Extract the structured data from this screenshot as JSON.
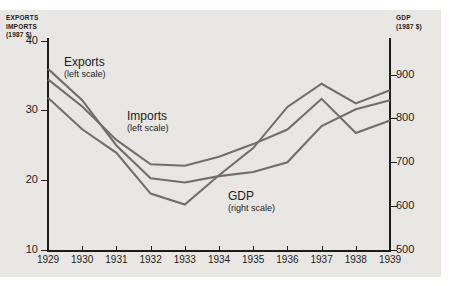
{
  "chart_data": {
    "type": "line",
    "title": "",
    "xlabel": "",
    "x": [
      1929,
      1930,
      1931,
      1932,
      1933,
      1934,
      1935,
      1936,
      1937,
      1938,
      1939
    ],
    "xticklabels": [
      "1929",
      "1930",
      "1931",
      "1932",
      "1933",
      "1934",
      "1935",
      "1936",
      "1937",
      "1938",
      "1939"
    ],
    "grid": false,
    "legend": "inline-annotations",
    "axes": [
      {
        "id": "left",
        "label": "EXPORTS\nIMPORTS\n(1987 $)",
        "label_lines": [
          "EXPORTS",
          "IMPORTS",
          "(1987 $)"
        ],
        "ylim": [
          10,
          40
        ],
        "yticks": [
          10,
          20,
          30,
          40
        ],
        "yticklabels": [
          "10",
          "20",
          "30",
          "40"
        ]
      },
      {
        "id": "right",
        "label": "GDP\n(1987 $)",
        "label_lines": [
          "GDP",
          "(1987 $)"
        ],
        "ylim": [
          500,
          900
        ],
        "yticks": [
          500,
          600,
          700,
          800,
          900
        ],
        "yticklabels": [
          "500",
          "600",
          "700",
          "800",
          "900"
        ]
      }
    ],
    "series": [
      {
        "name": "Exports",
        "scale_note": "(left scale)",
        "axis": "left",
        "color": "#6f6f6f",
        "values": [
          36.0,
          31.5,
          25.0,
          20.3,
          19.7,
          20.6,
          21.2,
          22.6,
          27.8,
          30.2,
          31.5
        ]
      },
      {
        "name": "Imports",
        "scale_note": "(left scale)",
        "axis": "left",
        "color": "#6f6f6f",
        "values": [
          34.5,
          30.6,
          25.8,
          22.3,
          22.1,
          23.4,
          25.2,
          27.3,
          31.7,
          26.8,
          28.6
        ]
      },
      {
        "name": "GDP",
        "scale_note": "(right scale)",
        "axis": "right",
        "color": "#6f6f6f",
        "values": [
          848,
          776,
          722,
          629,
          604,
          671,
          733,
          827,
          880,
          835,
          865
        ]
      }
    ]
  },
  "annotations": [
    {
      "name": "Exports",
      "scale_note": "(left scale)"
    },
    {
      "name": "Imports",
      "scale_note": "(left scale)"
    },
    {
      "name": "GDP",
      "scale_note": "(right scale)"
    }
  ],
  "style": {
    "panel_background": "#e9e7e3",
    "line_color": "#6f6f6f",
    "axis_color": "#1c1c1c",
    "page_background": "#ffffff"
  }
}
